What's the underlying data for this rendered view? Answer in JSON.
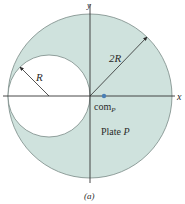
{
  "figure": {
    "caption": "(a)",
    "axes": {
      "x_label": "x",
      "y_label": "y"
    },
    "large_circle": {
      "radius_label": "2R",
      "fill": "#cfe2dd",
      "stroke": "#7a8a86"
    },
    "small_circle": {
      "radius_label": "R",
      "fill": "#ffffff"
    },
    "center_of_mass": {
      "label": "com",
      "subscript": "P",
      "color": "#4a7fb5"
    },
    "plate_label": {
      "text": "Plate ",
      "name": "P"
    }
  }
}
